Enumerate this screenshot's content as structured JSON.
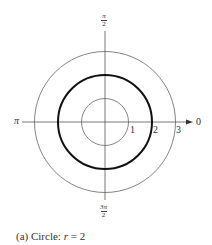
{
  "figure": {
    "type": "polar-graph",
    "center": {
      "x": 105,
      "y": 122
    },
    "unit_px": 23.5,
    "axis_color": "#555555",
    "circles": [
      {
        "r": 1,
        "stroke": "#666666",
        "width": 0.8,
        "highlight": false
      },
      {
        "r": 2,
        "stroke": "#111111",
        "width": 2.0,
        "highlight": true
      },
      {
        "r": 3,
        "stroke": "#666666",
        "width": 0.8,
        "highlight": false
      }
    ],
    "angle_labels": {
      "zero": "0",
      "pi": "π",
      "pi_over_2": {
        "num": "π",
        "den": "2"
      },
      "three_pi_over_2": {
        "num": "3π",
        "den": "2"
      }
    },
    "radial_labels": [
      "1",
      "2",
      "3"
    ]
  },
  "caption": {
    "prefix": "(a) Circle: ",
    "variable": "r",
    "equation_rest": " = 2"
  }
}
